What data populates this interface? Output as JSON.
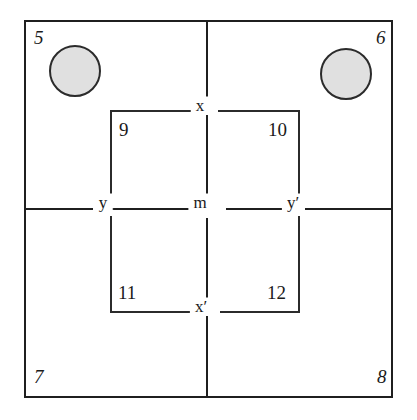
{
  "diagram": {
    "background_color": "#ffffff",
    "line_color": "#1f1f1f",
    "circle_fill_color": "#e0e0e0",
    "circle_stroke_color": "#2b2b2b",
    "corner_labels": [
      {
        "id": "corner-5",
        "text": "5",
        "position": "top-left"
      },
      {
        "id": "corner-6",
        "text": "6",
        "position": "top-right"
      },
      {
        "id": "corner-7",
        "text": "7",
        "position": "bottom-left"
      },
      {
        "id": "corner-8",
        "text": "8",
        "position": "bottom-right"
      }
    ],
    "region_labels": [
      {
        "id": "region-9",
        "text": "9",
        "position": "upper-left-inner"
      },
      {
        "id": "region-10",
        "text": "10",
        "position": "upper-right-inner"
      },
      {
        "id": "region-11",
        "text": "11",
        "position": "lower-left-inner"
      },
      {
        "id": "region-12",
        "text": "12",
        "position": "lower-right-inner"
      }
    ],
    "node_labels": [
      {
        "id": "node-x",
        "text": "x",
        "position": "top-center"
      },
      {
        "id": "node-x-prime",
        "text": "x′",
        "position": "bottom-center"
      },
      {
        "id": "node-y",
        "text": "y",
        "position": "middle-left"
      },
      {
        "id": "node-m",
        "text": "m",
        "position": "center"
      },
      {
        "id": "node-y-prime",
        "text": "y′",
        "position": "middle-right"
      }
    ],
    "circles": [
      {
        "id": "circle-top-left",
        "fill": "#e0e0e0"
      },
      {
        "id": "circle-top-right",
        "fill": "#e0e0e0"
      }
    ]
  }
}
